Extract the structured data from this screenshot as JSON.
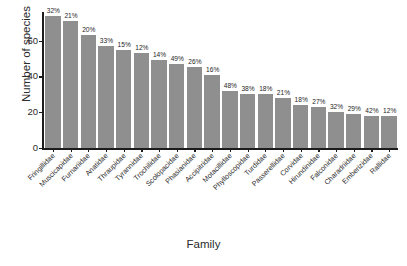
{
  "chart_data": {
    "type": "bar",
    "title": "",
    "subtitle": "",
    "xlabel": "Family",
    "ylabel": "Number of species",
    "ylim": [
      0,
      76
    ],
    "yticks": [
      0,
      20,
      40,
      60
    ],
    "ytick_labels": [
      "0",
      "20",
      "40",
      "60"
    ],
    "grid": false,
    "legend": false,
    "bar_color": "#8f8f8f",
    "axis_color": "#1c1c1c",
    "categories": [
      "Fringillidae",
      "Muscicapidae",
      "Furnariidae",
      "Anatidae",
      "Thraupidae",
      "Tyrannidae",
      "Trochilidae",
      "Scolopacidae",
      "Phasianidae",
      "Accipitridae",
      "Motacillidae",
      "Phylloscopidae",
      "Turdidae",
      "Passerellidae",
      "Corvidae",
      "Hirundinidae",
      "Falconidae",
      "Charadriidae",
      "Emberizidae",
      "Rallidae"
    ],
    "values": [
      74,
      71,
      63,
      57,
      55,
      53,
      49,
      47,
      45,
      41,
      32,
      30,
      30,
      28,
      24,
      23,
      20,
      19,
      18,
      18
    ],
    "bar_labels": [
      "32%",
      "21%",
      "20%",
      "33%",
      "15%",
      "12%",
      "14%",
      "49%",
      "26%",
      "16%",
      "48%",
      "38%",
      "18%",
      "21%",
      "18%",
      "27%",
      "32%",
      "29%",
      "42%",
      "12%"
    ]
  }
}
